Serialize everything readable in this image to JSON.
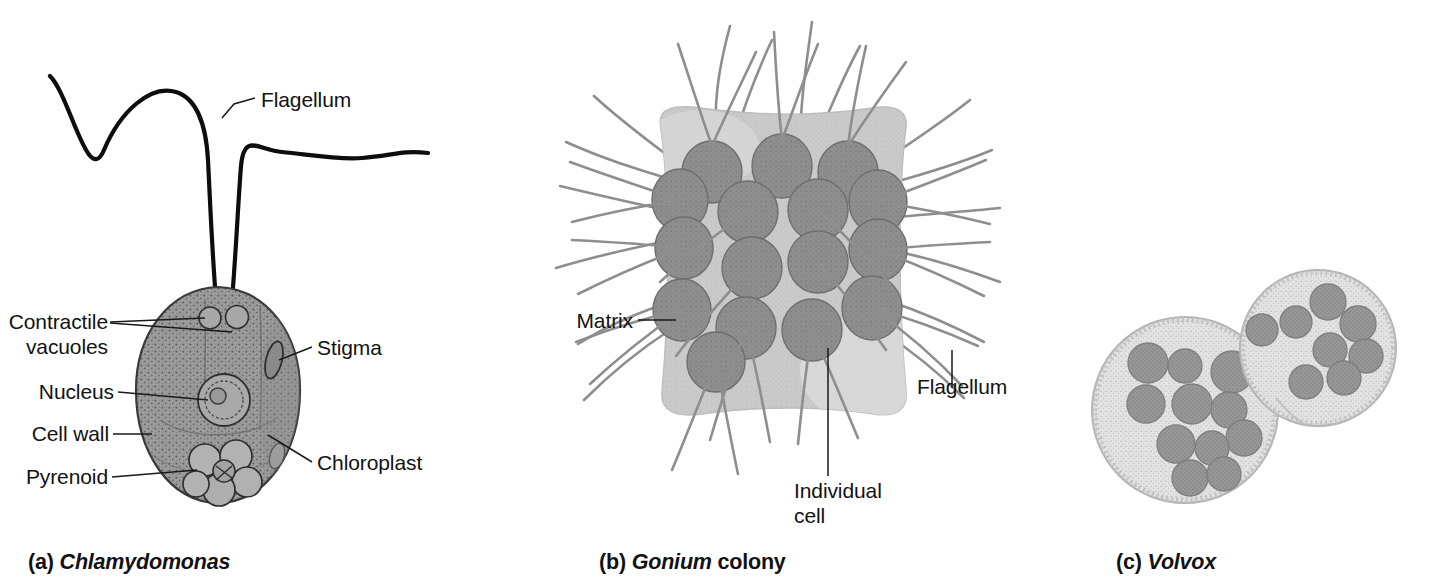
{
  "figure": {
    "background_color": "#ffffff",
    "panels": [
      {
        "id": "a",
        "caption_prefix": "(a)",
        "caption_name": "Chlamydomonas",
        "caption_suffix": "",
        "labels": [
          {
            "text": "Flagellum",
            "align": "left"
          },
          {
            "text": "Contractile",
            "align": "right"
          },
          {
            "text": "vacuoles",
            "align": "right"
          },
          {
            "text": "Nucleus",
            "align": "right"
          },
          {
            "text": "Cell wall",
            "align": "right"
          },
          {
            "text": "Pyrenoid",
            "align": "right"
          },
          {
            "text": "Stigma",
            "align": "left"
          },
          {
            "text": "Chloroplast",
            "align": "left"
          }
        ]
      },
      {
        "id": "b",
        "caption_prefix": "(b)",
        "caption_name": "Gonium",
        "caption_suffix": " colony",
        "labels": [
          {
            "text": "Matrix",
            "align": "right"
          },
          {
            "text": "Flagellum",
            "align": "left"
          },
          {
            "text": "Individual",
            "align": "left"
          },
          {
            "text": "cell",
            "align": "left"
          }
        ]
      },
      {
        "id": "c",
        "caption_prefix": "(c)",
        "caption_name": "Volvox",
        "caption_suffix": "",
        "labels": []
      }
    ]
  },
  "panel_a": {
    "caption_prefix": "(a)",
    "caption_name": "Chlamydomonas",
    "label_flagellum": "Flagellum",
    "label_contractile_line1": "Contractile",
    "label_contractile_line2": "vacuoles",
    "label_nucleus": "Nucleus",
    "label_cell_wall": "Cell wall",
    "label_pyrenoid": "Pyrenoid",
    "label_stigma": "Stigma",
    "label_chloroplast": "Chloroplast",
    "organelle_count": {
      "flagella": 2,
      "contractile_vacuoles": 2,
      "nucleus": 1,
      "stigma": 1,
      "pyrenoid_lobes": 6
    },
    "colors": {
      "cell_body": "#9c9c9c",
      "cell_outline": "#3a3a3a",
      "flagellum": "#0d0d0d",
      "nucleus": "#a6a6a6",
      "stigma": "#8c8c8c",
      "pyrenoid": "#b0b0b0"
    }
  },
  "panel_b": {
    "caption_prefix": "(b)",
    "caption_name": "Gonium",
    "caption_suffix": " colony",
    "label_matrix": "Matrix",
    "label_flagellum": "Flagellum",
    "label_individual_line1": "Individual",
    "label_individual_line2": "cell",
    "cell_count": 16,
    "flagella_per_cell": 2,
    "colors": {
      "matrix": "#c8c8c8",
      "matrix_light": "#d6d6d6",
      "cell": "#8d8d8d",
      "cell_outline": "#6f6f6f",
      "flagellum": "#8e8e8e"
    }
  },
  "panel_c": {
    "caption_prefix": "(c)",
    "caption_name": "Volvox",
    "sphere_count": 2,
    "daughter_colonies": [
      11,
      9
    ],
    "colors": {
      "sphere": "#e2e2e2",
      "sphere_edge": "#b8b8b8",
      "daughter": "#949494",
      "daughter_outline": "#7a7a7a"
    }
  }
}
